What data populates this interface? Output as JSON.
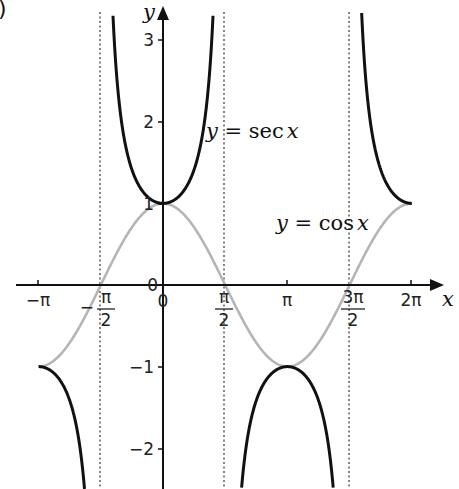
{
  "corner_mark": ")",
  "chart_data": {
    "type": "line",
    "title": "",
    "xlabel": "x",
    "ylabel": "y",
    "xlim_radians": [
      -3.35,
      6.6
    ],
    "ylim": [
      -2.5,
      3.3
    ],
    "grid": false,
    "legend": "inline labels",
    "x_ticks": [
      {
        "value": -3.1416,
        "label": "−π"
      },
      {
        "value": -1.5708,
        "label": "−π/2"
      },
      {
        "value": 0,
        "label": "0"
      },
      {
        "value": 1.5708,
        "label": "π/2"
      },
      {
        "value": 3.1416,
        "label": "π"
      },
      {
        "value": 4.7124,
        "label": "3π/2"
      },
      {
        "value": 6.2832,
        "label": "2π"
      }
    ],
    "y_ticks": [
      {
        "value": 3,
        "label": "3"
      },
      {
        "value": 2,
        "label": "2"
      },
      {
        "value": 1,
        "label": "1"
      },
      {
        "value": 0,
        "label": "0"
      },
      {
        "value": -1,
        "label": "−1"
      },
      {
        "value": -2,
        "label": "−2"
      }
    ],
    "asymptotes_x": [
      "−π/2",
      "π/2",
      "3π/2"
    ],
    "series": [
      {
        "name": "y = sec x",
        "color": "#111111",
        "function": "sec(x)",
        "domain": "[-π, 2π] excluding asymptotes",
        "key_points": [
          [
            -3.1416,
            -1
          ],
          [
            0,
            1
          ],
          [
            3.1416,
            -1
          ],
          [
            6.2832,
            1
          ]
        ]
      },
      {
        "name": "y = cos x",
        "color": "#b3b3b3",
        "function": "cos(x)",
        "domain": "[-π, 2π]",
        "key_points": [
          [
            -3.1416,
            -1
          ],
          [
            -1.5708,
            0
          ],
          [
            0,
            1
          ],
          [
            1.5708,
            0
          ],
          [
            3.1416,
            -1
          ],
          [
            4.7124,
            0
          ],
          [
            6.2832,
            1
          ]
        ]
      }
    ]
  },
  "labels": {
    "sec": {
      "y": "y",
      "eq": " = sec",
      "x": "x"
    },
    "cos": {
      "y": "y",
      "eq": " = cos",
      "x": "x"
    },
    "axis_x": "x",
    "axis_y": "y",
    "x_ticks": {
      "neg_pi": "−π",
      "neg_half_pi_num": "π",
      "neg_half_pi_sign": "−",
      "neg_half_pi_den": "2",
      "zero": "0",
      "half_pi_num": "π",
      "half_pi_den": "2",
      "pi": "π",
      "three_half_pi_num": "3π",
      "three_half_pi_den": "2",
      "two_pi": "2π"
    },
    "y_ticks": {
      "three": "3",
      "two": "2",
      "one": "1",
      "zero": "0",
      "neg_one": "−1",
      "neg_two": "−2"
    }
  }
}
